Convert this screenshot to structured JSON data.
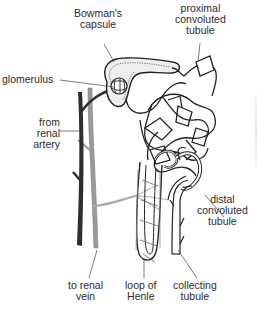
{
  "diagram": {
    "labels": {
      "bowmans_capsule": [
        "Bowman's",
        "capsule"
      ],
      "proximal_tubule": [
        "proximal",
        "convoluted",
        "tubule"
      ],
      "glomerulus": [
        "glomerulus"
      ],
      "renal_artery": [
        "from",
        "renal",
        "artery"
      ],
      "distal_tubule": [
        "distal",
        "convoluted",
        "tubule"
      ],
      "renal_vein": [
        "to renal",
        "vein"
      ],
      "loop_of_henle": [
        "loop of",
        "Henle"
      ],
      "collecting_tubule": [
        "collecting",
        "tubule"
      ]
    },
    "colors": {
      "outline": "#222222",
      "artery": "#2e2e2e",
      "vein": "#9a9a9a",
      "capsule_fill": "#eeeeee",
      "capillary": "#a8a8a8"
    }
  }
}
